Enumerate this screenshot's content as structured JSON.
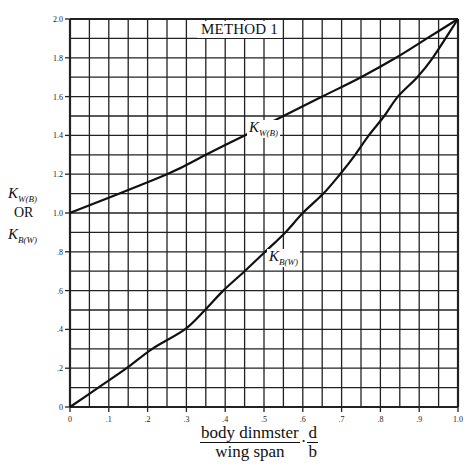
{
  "chart_data": {
    "type": "line",
    "title": "METHOD 1",
    "xlabel": "body dinmster / wing span, d / b",
    "ylabel": "K_W(B) OR K_B(W)",
    "xlim": [
      0,
      1.0
    ],
    "ylim": [
      0,
      2.0
    ],
    "grid": true,
    "x_ticks": [
      "0",
      ".1",
      ".2",
      ".3",
      ".4",
      ".5",
      ".6",
      ".7",
      ".8",
      ".9",
      "1.0"
    ],
    "y_ticks": [
      "0",
      ".2",
      ".4",
      ".6",
      ".8",
      "1.0",
      "1.2",
      "1.4",
      "1.6",
      "1.8",
      "2.0"
    ],
    "series": [
      {
        "name": "K_W(B)",
        "x": [
          0,
          0.25,
          0.35,
          0.45,
          0.55,
          0.65,
          0.75,
          0.84,
          0.92,
          1.0
        ],
        "y": [
          1.0,
          1.2,
          1.3,
          1.4,
          1.5,
          1.6,
          1.7,
          1.8,
          1.9,
          2.0
        ]
      },
      {
        "name": "K_B(W)",
        "x": [
          0,
          0.073,
          0.146,
          0.212,
          0.296,
          0.348,
          0.395,
          0.45,
          0.503,
          0.555,
          0.6,
          0.653,
          0.696,
          0.735,
          0.77,
          0.81,
          0.845,
          0.895,
          0.935,
          1.0
        ],
        "y": [
          0,
          0.1,
          0.2,
          0.3,
          0.4,
          0.5,
          0.6,
          0.7,
          0.8,
          0.9,
          1.0,
          1.1,
          1.2,
          1.3,
          1.4,
          1.5,
          1.6,
          1.7,
          1.8,
          2.0
        ]
      }
    ]
  },
  "labels": {
    "title": "METHOD 1",
    "y_axis": {
      "k1_main": "K",
      "k1_sub": "W(B)",
      "or": "OR",
      "k2_main": "K",
      "k2_sub": "B(W)"
    },
    "x_axis": {
      "num1": "body dinmster",
      "den1": "wing span",
      "sep": "·",
      "num2": "d",
      "den2": "b"
    },
    "curve_kwb": {
      "main": "K",
      "sub": "W(B)"
    },
    "curve_kbw": {
      "main": "K",
      "sub": "B(W)"
    }
  }
}
